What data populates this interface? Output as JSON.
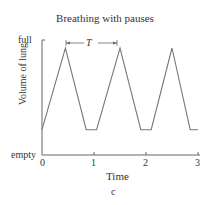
{
  "chart_data": {
    "type": "line",
    "title": "Breathing with pauses",
    "xlabel": "Time",
    "ylabel": "Volume of lung",
    "caption": "c",
    "x_ticks": [
      "0",
      "1",
      "2",
      "3"
    ],
    "y_ticks": [
      "empty",
      "full"
    ],
    "xlim": [
      0,
      3
    ],
    "ylim": [
      0,
      1
    ],
    "annotation": "T",
    "series": [
      {
        "name": "lung volume",
        "x": [
          0,
          0.45,
          0.85,
          1.05,
          1.5,
          1.9,
          2.1,
          2.5,
          2.85,
          3.0
        ],
        "y": [
          0.22,
          0.93,
          0.22,
          0.22,
          0.93,
          0.22,
          0.22,
          0.93,
          0.22,
          0.22
        ]
      }
    ],
    "color": "#777777"
  }
}
